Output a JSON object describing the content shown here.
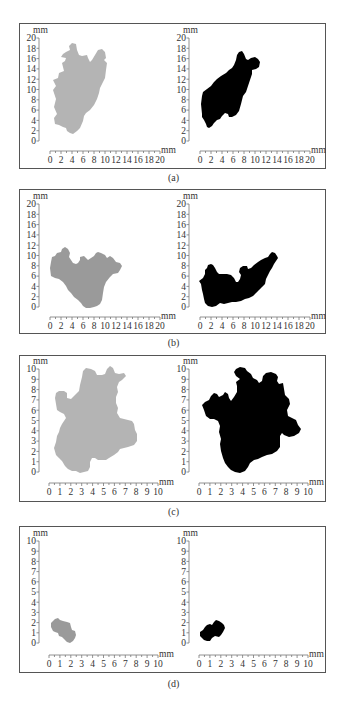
{
  "figure": {
    "panels": [
      {
        "id": "a",
        "caption": "(a)",
        "left_color": "#b4b4b4",
        "right_color": "#000000",
        "axis_max": 20,
        "tick_step": 2,
        "unit": "mm",
        "y_ticks": [
          "0",
          "2",
          "4",
          "6",
          "8",
          "10",
          "12",
          "14",
          "16",
          "18",
          "20"
        ],
        "x_ticks": [
          "0",
          "2",
          "4",
          "6",
          "8",
          "10",
          "12",
          "14",
          "16",
          "18",
          "20"
        ]
      },
      {
        "id": "b",
        "caption": "(b)",
        "left_color": "#9a9a9a",
        "right_color": "#000000",
        "axis_max": 20,
        "tick_step": 2,
        "unit": "mm",
        "y_ticks": [
          "0",
          "2",
          "4",
          "6",
          "8",
          "10",
          "12",
          "14",
          "16",
          "18",
          "20"
        ],
        "x_ticks": [
          "0",
          "2",
          "4",
          "6",
          "8",
          "10",
          "12",
          "14",
          "16",
          "18",
          "20"
        ]
      },
      {
        "id": "c",
        "caption": "(c)",
        "left_color": "#b4b4b4",
        "right_color": "#000000",
        "axis_max": 10,
        "tick_step": 1,
        "unit": "mm",
        "y_ticks": [
          "0",
          "1",
          "2",
          "3",
          "4",
          "5",
          "6",
          "7",
          "8",
          "9",
          "10"
        ],
        "x_ticks": [
          "0",
          "1",
          "2",
          "3",
          "4",
          "5",
          "6",
          "7",
          "8",
          "9",
          "10"
        ]
      },
      {
        "id": "d",
        "caption": "(d)",
        "left_color": "#9a9a9a",
        "right_color": "#000000",
        "axis_max": 10,
        "tick_step": 1,
        "unit": "mm",
        "y_ticks": [
          "0",
          "1",
          "2",
          "3",
          "4",
          "5",
          "6",
          "7",
          "8",
          "9",
          "10"
        ],
        "x_ticks": [
          "0",
          "1",
          "2",
          "3",
          "4",
          "5",
          "6",
          "7",
          "8",
          "9",
          "10"
        ]
      }
    ]
  },
  "chart_data": [
    {
      "type": "scatter",
      "title": "(a) left",
      "xlabel": "mm",
      "ylabel": "mm",
      "xlim": [
        0,
        20
      ],
      "ylim": [
        0,
        20
      ],
      "grid": false,
      "description": "gray irregular region spanning approx x 0.5-10 mm, y 0-13 mm"
    },
    {
      "type": "scatter",
      "title": "(a) right",
      "xlabel": "mm",
      "ylabel": "mm",
      "xlim": [
        0,
        20
      ],
      "ylim": [
        0,
        20
      ],
      "grid": false,
      "description": "black irregular region spanning approx x 0-10.5 mm, y 0-13 mm"
    },
    {
      "type": "scatter",
      "title": "(b) left",
      "xlabel": "mm",
      "ylabel": "mm",
      "xlim": [
        0,
        20
      ],
      "ylim": [
        0,
        20
      ],
      "grid": false,
      "description": "gray irregular region spanning approx x 0-14 mm, y 0-11 mm"
    },
    {
      "type": "scatter",
      "title": "(b) right",
      "xlabel": "mm",
      "ylabel": "mm",
      "xlim": [
        0,
        20
      ],
      "ylim": [
        0,
        20
      ],
      "grid": false,
      "description": "black irregular region spanning approx x 0-14.5 mm, y 0-10.5 mm"
    },
    {
      "type": "scatter",
      "title": "(c) left",
      "xlabel": "mm",
      "ylabel": "mm",
      "xlim": [
        0,
        10
      ],
      "ylim": [
        0,
        10
      ],
      "grid": false,
      "description": "gray irregular region spanning approx x 0.3-8.3 mm, y 0-10 mm"
    },
    {
      "type": "scatter",
      "title": "(c) right",
      "xlabel": "mm",
      "ylabel": "mm",
      "xlim": [
        0,
        10
      ],
      "ylim": [
        0,
        10
      ],
      "grid": false,
      "description": "black irregular region spanning approx x 0-9.5 mm, y 0-10 mm"
    },
    {
      "type": "scatter",
      "title": "(d) left",
      "xlabel": "mm",
      "ylabel": "mm",
      "xlim": [
        0,
        10
      ],
      "ylim": [
        0,
        10
      ],
      "grid": false,
      "description": "small gray region spanning approx x 0.3-2.3 mm, y 0-2.3 mm"
    },
    {
      "type": "scatter",
      "title": "(d) right",
      "xlabel": "mm",
      "ylabel": "mm",
      "xlim": [
        0,
        10
      ],
      "ylim": [
        0,
        10
      ],
      "grid": false,
      "description": "small black region spanning approx x 0-2.5 mm, y 0.2-2.2 mm"
    }
  ]
}
